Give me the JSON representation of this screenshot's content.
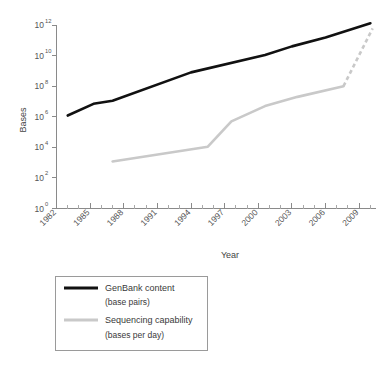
{
  "chart_data": {
    "type": "line",
    "title": "",
    "xlabel": "Year",
    "ylabel": "Bases",
    "xlim": [
      1982,
      2010.5
    ],
    "ylim": [
      1,
      1000000000000
    ],
    "yscale": "log",
    "grid": false,
    "legend_position": "below-plot-left",
    "x_ticks": [
      "1982",
      "1985",
      "1988",
      "1991",
      "1994",
      "1997",
      "2000",
      "2003",
      "2006",
      "2009"
    ],
    "x_tick_values": [
      1982,
      1985,
      1988,
      1991,
      1994,
      1997,
      2000,
      2003,
      2006,
      2009
    ],
    "x_minor_tick_values": [
      1983,
      1984,
      1986,
      1987,
      1989,
      1990,
      1992,
      1993,
      1995,
      1996,
      1998,
      1999,
      2001,
      2002,
      2004,
      2005,
      2007,
      2008,
      2010
    ],
    "y_ticks": [
      {
        "base": "10",
        "exp": "0",
        "value": 1
      },
      {
        "base": "10",
        "exp": "2",
        "value": 100
      },
      {
        "base": "10",
        "exp": "4",
        "value": 10000
      },
      {
        "base": "10",
        "exp": "6",
        "value": 1000000
      },
      {
        "base": "10",
        "exp": "8",
        "value": 100000000
      },
      {
        "base": "10",
        "exp": "10",
        "value": 10000000000
      },
      {
        "base": "10",
        "exp": "12",
        "value": 1000000000000
      }
    ],
    "series": [
      {
        "name": "GenBank content",
        "sublabel": "(base pairs)",
        "color": "#111111",
        "style": "solid",
        "x": [
          1983.0,
          1985.3,
          1987.0,
          1994.0,
          2000.6,
          2003.0,
          2006.0,
          2010.0
        ],
        "y": [
          1200000,
          7000000,
          11000000,
          800000000,
          11000000000,
          40000000000,
          150000000000,
          1300000000000
        ]
      },
      {
        "name": "Sequencing capability",
        "sublabel": "(bases per day)",
        "color": "#c9c9c9",
        "style": "solid-then-dashed",
        "x": [
          1987.0,
          1995.5,
          1997.6,
          2000.6,
          2003.5,
          2007.6
        ],
        "y": [
          1200,
          11000,
          500000,
          5000000,
          20000000,
          100000000
        ],
        "dashed_x": [
          2007.6,
          2010.2
        ],
        "dashed_y": [
          100000000,
          600000000000
        ]
      }
    ]
  },
  "legend": {
    "entries": [
      {
        "label": "GenBank content",
        "sublabel": "(base pairs)",
        "color": "#111111"
      },
      {
        "label": "Sequencing capability",
        "sublabel": "(bases per day)",
        "color": "#c9c9c9"
      }
    ]
  }
}
